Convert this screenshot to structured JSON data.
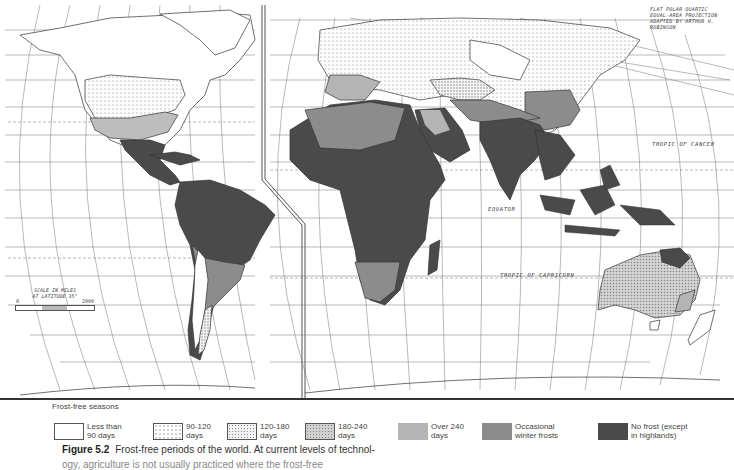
{
  "figure": {
    "number_label": "Figure 5.2",
    "caption": "Frost-free periods of the world. At current levels of technol-",
    "caption_next_line": "ogy, agriculture is not usually practiced where the frost-free"
  },
  "map": {
    "projection_note": [
      "FLAT POLAR QUARTIC",
      "EQUAL-AREA PROJECTION",
      "ADAPTED BY ARTHUR H. ROBINSON"
    ],
    "labels": {
      "tropic_of_cancer": "TROPIC OF CANCER",
      "equator": "EQUATOR",
      "tropic_of_capricorn": "TROPIC OF CAPRICORN"
    },
    "scale": {
      "title_line1": "SCALE IN MILES",
      "title_line2": "AT LATITUDE 35°",
      "min": "0",
      "max": "2000"
    },
    "latitude_ticks_left": [
      "70",
      "60",
      "50",
      "40",
      "30",
      "20",
      "10",
      "0",
      "10",
      "20",
      "30",
      "40",
      "50",
      "60"
    ],
    "colors": {
      "no_frost": "#4a4a4a",
      "occasional_winter_frosts": "#8c8c8c",
      "over_240": "#b4b4b4",
      "d180_240": "#c8c8c8",
      "d120_180": "#dcdcdc",
      "d90_120": "#ececec",
      "lt90": "#ffffff",
      "grid": "#7a7a7a",
      "interruption_line": "#555555"
    }
  },
  "legend": {
    "title": "Frost-free seasons",
    "items": [
      {
        "label": "Less than\n90 days",
        "pattern": "blank"
      },
      {
        "label": "90-120\ndays",
        "pattern": "sparse-dots"
      },
      {
        "label": "120-180\ndays",
        "pattern": "dense-dots"
      },
      {
        "label": "180-240\ndays",
        "pattern": "fine-hatch"
      },
      {
        "label": "Over 240\ndays",
        "pattern": "light-gray"
      },
      {
        "label": "Occasional\nwinter frosts",
        "pattern": "mid-gray"
      },
      {
        "label": "No frost (except\nin highlands)",
        "pattern": "dark-gray"
      }
    ]
  }
}
